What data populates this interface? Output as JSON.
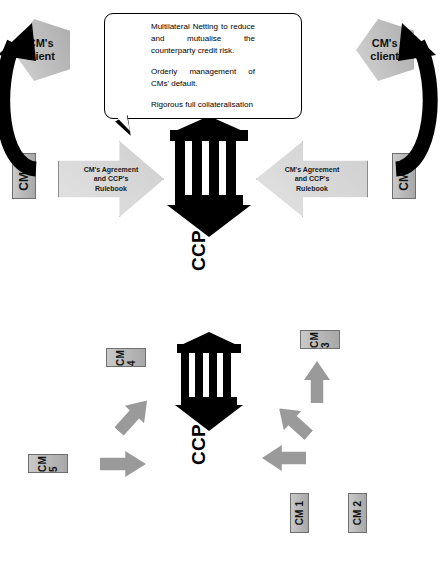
{
  "figure": {
    "colors": {
      "box_fill": "#b5b5b5",
      "box_border": "#6f6f6f",
      "arrow_gray": "#9a9a9a",
      "arrow_outline_fill": "#d8d8d8",
      "client_fill": "#c0c0c0",
      "temple_black": "#000000"
    }
  },
  "left_panel": {
    "center_label": "CCP",
    "members": [
      {
        "id": "cm1",
        "label": "CM 1",
        "arrow": "up"
      },
      {
        "id": "cm2",
        "label": "CM 2",
        "arrow": "diagonal-up-left"
      },
      {
        "id": "cm3",
        "label": "CM 3",
        "arrow": "left"
      },
      {
        "id": "cm4",
        "label": "CM 4",
        "arrow": "diagonal-down-left"
      },
      {
        "id": "cm5",
        "label": "CM 5",
        "arrow": "down"
      }
    ]
  },
  "right_panel": {
    "center_label": "CCP",
    "members": [
      {
        "id": "cm5",
        "label": "CM 5"
      },
      {
        "id": "cm1",
        "label": "CM 1"
      }
    ],
    "clients": [
      {
        "id": "client-top",
        "label": "CM's\nclient",
        "line1": "CM's",
        "line2": "client"
      },
      {
        "id": "client-bottom",
        "label": "CM's\nclient",
        "line1": "CM's",
        "line2": "client"
      }
    ],
    "agreement_arrows": [
      {
        "id": "agreement-top",
        "line1": "CM's Agreement",
        "line2": "and CCP's",
        "line3": "Rulebook",
        "direction": "down"
      },
      {
        "id": "agreement-bottom",
        "line1": "CM's Agreement",
        "line2": "and CCP's",
        "line3": "Rulebook",
        "direction": "up"
      }
    ],
    "callout": {
      "items": [
        "Multilateral Netting to reduce and mutualise the counterparty credit risk.",
        "Orderly management of CMs' default.",
        "Rigorous full collateralisation"
      ]
    }
  }
}
